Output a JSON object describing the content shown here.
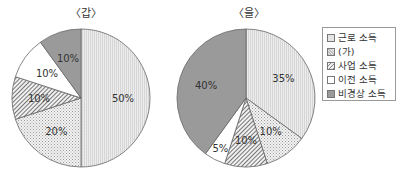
{
  "chart_data": [
    {
      "type": "pie",
      "title": "〈갑〉",
      "categories": [
        "근로 소득",
        "(가)",
        "사업 소득",
        "이전 소득",
        "비경상 소득"
      ],
      "values": [
        50,
        20,
        10,
        10,
        10
      ],
      "labels": [
        "50%",
        "20%",
        "10%",
        "10%",
        "10%"
      ],
      "start_angle": "12 o'clock, clockwise"
    },
    {
      "type": "pie",
      "title": "〈을〉",
      "categories": [
        "근로 소득",
        "(가)",
        "사업 소득",
        "이전 소득",
        "비경상 소득"
      ],
      "values": [
        35,
        10,
        10,
        5,
        40
      ],
      "labels": [
        "35%",
        "10%",
        "10%",
        "5%",
        "40%"
      ],
      "start_angle": "12 o'clock, clockwise"
    }
  ],
  "legend": {
    "position": "right",
    "items": [
      "근로 소득",
      "(가)",
      "사업 소득",
      "이전 소득",
      "비경상 소득"
    ]
  },
  "colors": {
    "근로 소득": "#e4e4e4",
    "(가)": "#dcdcdc dotted",
    "사업 소득": "#c8c8c8 hatched",
    "이전 소득": "#ffffff",
    "비경상 소득": "#9a9a9a"
  }
}
